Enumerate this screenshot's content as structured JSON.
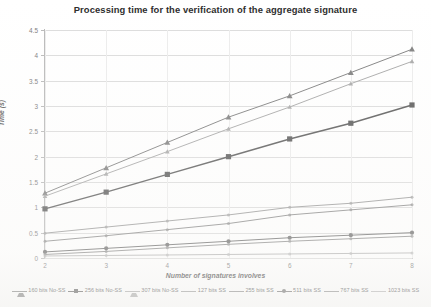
{
  "chart_data": {
    "type": "line",
    "title": "Processing time for the verification of the aggregate signature",
    "xlabel": "Number of signatures involves",
    "ylabel": "Time (s)",
    "x": [
      2,
      3,
      4,
      5,
      6,
      7,
      8
    ],
    "xlim": [
      2,
      8
    ],
    "ylim": [
      0,
      4.5
    ],
    "ytick_labels": [
      "0",
      "0.5",
      "1",
      "1.5",
      "2",
      "2.5",
      "3",
      "3.5",
      "4",
      "4.5"
    ],
    "ytick_values": [
      0,
      0.5,
      1,
      1.5,
      2,
      2.5,
      3,
      3.5,
      4,
      4.5
    ],
    "xtick_labels": [
      "2",
      "3",
      "4",
      "5",
      "6",
      "7",
      "8"
    ],
    "grid": "horizontal-and-vertical",
    "legend_position": "bottom",
    "series": [
      {
        "name": "160 bits No-SS",
        "marker": "triangle",
        "color": "#7f7f7f",
        "values": [
          1.28,
          1.78,
          2.28,
          2.78,
          3.2,
          3.66,
          4.12
        ]
      },
      {
        "name": "256 bits No-SS",
        "marker": "square",
        "color": "#5a5a5a",
        "values": [
          0.97,
          1.3,
          1.65,
          2.0,
          2.35,
          2.66,
          3.02
        ]
      },
      {
        "name": "307 bits No-SS",
        "marker": "triangle-small",
        "color": "#a8a8a8",
        "values": [
          1.22,
          1.66,
          2.1,
          2.55,
          2.98,
          3.44,
          3.88
        ]
      },
      {
        "name": "127 bits SS",
        "marker": "none",
        "color": "#9a9a9a",
        "values": [
          0.49,
          0.61,
          0.73,
          0.85,
          1.0,
          1.08,
          1.2
        ]
      },
      {
        "name": "255 bits SS",
        "marker": "none",
        "color": "#8a8a8a",
        "values": [
          0.33,
          0.44,
          0.56,
          0.68,
          0.85,
          0.95,
          1.05
        ]
      },
      {
        "name": "511 bits SS",
        "marker": "circle",
        "color": "#6e6e6e",
        "values": [
          0.12,
          0.19,
          0.26,
          0.33,
          0.4,
          0.45,
          0.5
        ]
      },
      {
        "name": "767 bits SS",
        "marker": "none",
        "color": "#8f8f8f",
        "values": [
          0.07,
          0.13,
          0.2,
          0.27,
          0.33,
          0.38,
          0.43
        ]
      },
      {
        "name": "1023 bits SS",
        "marker": "none",
        "color": "#b5b5b5",
        "values": [
          0.04,
          0.05,
          0.06,
          0.07,
          0.08,
          0.09,
          0.1
        ]
      }
    ]
  }
}
